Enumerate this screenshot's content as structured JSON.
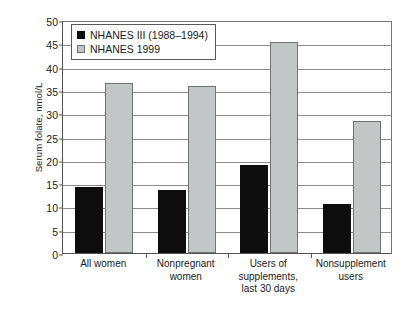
{
  "chart_data": {
    "type": "bar",
    "title": "",
    "xlabel": "",
    "ylabel": "Serum folate, nmol/L",
    "ylim": [
      0,
      50
    ],
    "ytick_step": 5,
    "yticks": [
      0,
      5,
      10,
      15,
      20,
      25,
      30,
      35,
      40,
      45,
      50
    ],
    "ytick_labels": [
      "0",
      "5",
      "10",
      "15",
      "20",
      "25",
      "30",
      "35",
      "40",
      "45",
      "50"
    ],
    "grid": true,
    "legend_position": "top-left-inside",
    "categories": [
      "All women",
      "Nonpregnant women",
      "Users of supplements, last 30 days",
      "Nonsupplement users"
    ],
    "category_lines": [
      [
        "All women"
      ],
      [
        "Nonpregnant",
        "women"
      ],
      [
        "Users of",
        "supplements,",
        "last 30 days"
      ],
      [
        "Nonsupplement",
        "users"
      ]
    ],
    "series": [
      {
        "name": "NHANES III (1988–1994)",
        "color": "#0d0d0d",
        "values": [
          14.2,
          13.6,
          18.9,
          10.5
        ]
      },
      {
        "name": "NHANES 1999",
        "color": "#c3c6c6",
        "values": [
          36.5,
          35.8,
          45.2,
          28.3
        ]
      }
    ]
  },
  "legend": {
    "items": [
      {
        "label": "NHANES III (1988–1994)",
        "swatch": "series-0-swatch"
      },
      {
        "label": "NHANES 1999",
        "swatch": "series-1-swatch"
      }
    ]
  },
  "axes": {
    "y_title": "Serum folate, nmol/L"
  },
  "colors": {
    "series_0": "#0d0d0d",
    "series_1": "#c3c6c6",
    "series_1_border": "#6e7272",
    "gridline": "#8c8c8c",
    "axis": "#555555",
    "background": "#ffffff",
    "text": "#1a1a1a"
  }
}
